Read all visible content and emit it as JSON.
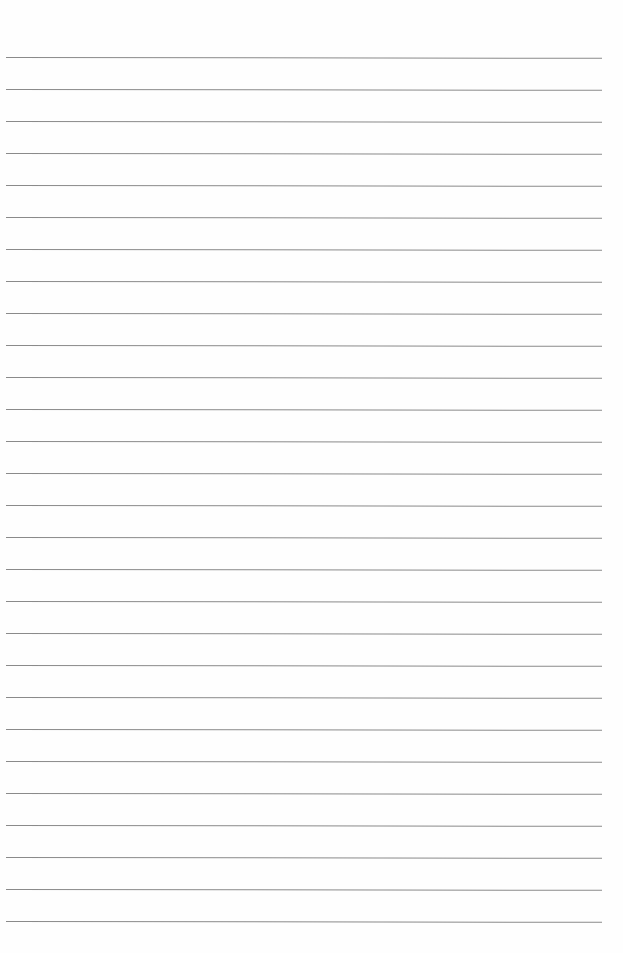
{
  "page": {
    "type": "ruled-paper",
    "background": "#fefefe",
    "line_color": "#8a8a8a",
    "line_count": 28,
    "first_line_y": 57,
    "line_spacing": 32,
    "line_left": 6,
    "line_width": 596
  }
}
